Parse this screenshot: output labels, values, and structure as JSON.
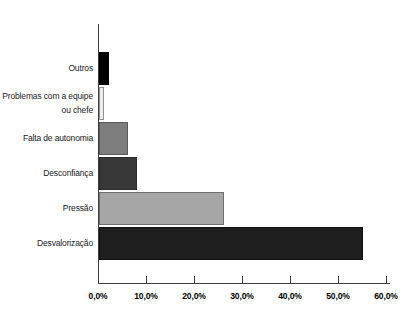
{
  "chart_data": {
    "type": "bar",
    "orientation": "horizontal",
    "title": "",
    "xlabel": "",
    "ylabel": "",
    "categories": [
      "Outros",
      "Problemas com a equipe ou chefe",
      "Falta de autonomia",
      "Desconfiança",
      "Pressão",
      "Desvalorização"
    ],
    "values": [
      2,
      1,
      6,
      8,
      26,
      55
    ],
    "unit": "%",
    "xlim": [
      0,
      60
    ],
    "x_tick_values": [
      0,
      10,
      20,
      30,
      40,
      50,
      60
    ],
    "x_tick_labels": [
      "0,0%",
      "10,0%",
      "20,0%",
      "30,0%",
      "40,0%",
      "50,0%",
      "60,0%"
    ],
    "grid": false,
    "legend": null,
    "bar_fill_colors": [
      "#000000",
      "#ececec",
      "#7d7d7d",
      "#383838",
      "#a6a6a6",
      "#1e1e1e"
    ],
    "bar_border_colors": [
      "#000000",
      "#8f8f8f",
      "#5a5a5a",
      "#2a2a2a",
      "#6e6e6e",
      "#111111"
    ]
  },
  "colors": {
    "background": "#ffffff",
    "axis": "#3c3c3c",
    "category_text": "#1a1a1a",
    "tick_text": "#000000"
  }
}
